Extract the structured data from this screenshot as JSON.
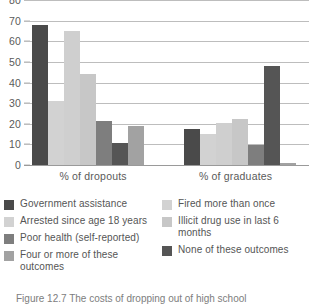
{
  "chart_data": {
    "type": "bar",
    "title": "",
    "xlabel": "",
    "ylabel": "",
    "ylim": [
      0,
      80
    ],
    "yticks": [
      0,
      10,
      20,
      30,
      40,
      50,
      60,
      70,
      80
    ],
    "grid": true,
    "legend_position": "bottom",
    "categories": [
      "% of dropouts",
      "% of graduates"
    ],
    "series": [
      {
        "name": "Government assistance",
        "color": "#4a4a4a",
        "values": [
          68,
          17.5
        ]
      },
      {
        "name": "Fired more than once",
        "color": "#d2d2d2",
        "values": [
          31,
          15
        ]
      },
      {
        "name": "Arrested since age\n18 years",
        "color": "#cfcfcf",
        "values": [
          65,
          20.5
        ]
      },
      {
        "name": "Illicit drug use in last\n6 months",
        "color": "#c7c7c7",
        "values": [
          44,
          22.5
        ]
      },
      {
        "name": "Poor health (self-reported)",
        "color": "#7e7e7e",
        "values": [
          21.5,
          9.5
        ]
      },
      {
        "name": "None of these outcomes",
        "color": "#555555",
        "values": [
          10.5,
          48
        ]
      },
      {
        "name": "Four or more of these\noutcomes",
        "color": "#a2a2a2",
        "values": [
          19,
          1
        ]
      }
    ]
  },
  "axis": {
    "y_tick_labels": [
      "80",
      "70",
      "60",
      "50",
      "40",
      "30",
      "20",
      "10",
      "0"
    ],
    "x_tick_labels": [
      "% of dropouts",
      "% of graduates"
    ]
  },
  "legend": {
    "column_left": [
      {
        "label": "Government assistance",
        "color": "#4a4a4a"
      },
      {
        "label": "Arrested since age 18 years",
        "color": "#d2d2d2"
      },
      {
        "label": "Poor health (self-reported)",
        "color": "#7e7e7e"
      },
      {
        "label": "Four or more of these outcomes",
        "color": "#a2a2a2"
      }
    ],
    "column_right": [
      {
        "label": "Fired more than once",
        "color": "#d2d2d2"
      },
      {
        "label": "Illicit drug use in last 6 months",
        "color": "#c7c7c7"
      },
      {
        "label": "None of these outcomes",
        "color": "#555555"
      }
    ]
  },
  "caption": {
    "text": "Figure 12.7   The costs of dropping out of high school"
  }
}
